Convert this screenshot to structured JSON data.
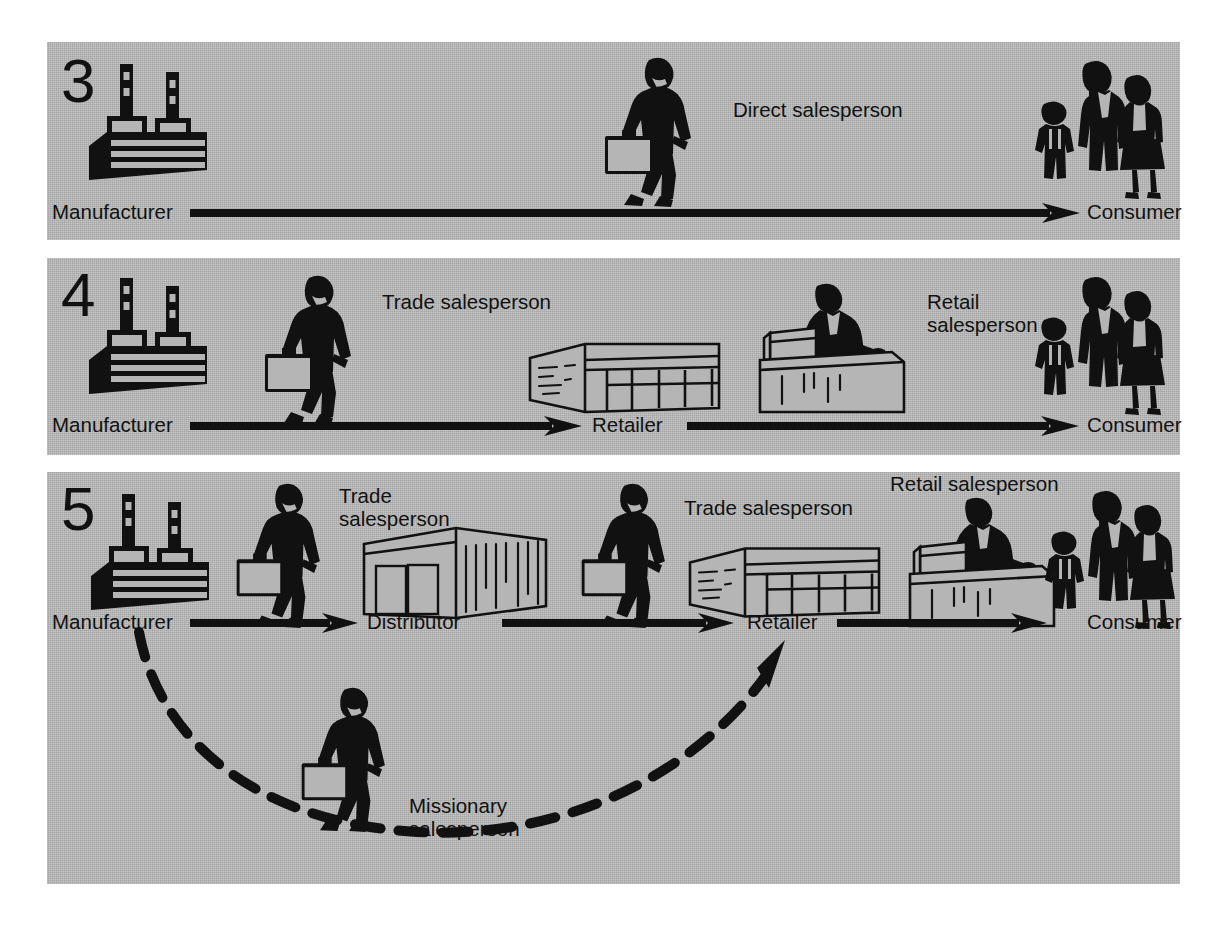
{
  "diagram": {
    "title_visible": false,
    "background_color": "#b5b5b5",
    "ink_color": "#111111",
    "panels": [
      {
        "number": "3",
        "nodes": [
          {
            "id": "manufacturer",
            "label": "Manufacturer",
            "icon": "factory-icon"
          },
          {
            "id": "consumer",
            "label": "Consumer",
            "icon": "consumer-family-icon"
          }
        ],
        "roles": [
          {
            "id": "direct-salesperson",
            "label": "Direct salesperson",
            "icon": "walking-salesperson-icon"
          }
        ],
        "arrows": [
          {
            "from": "manufacturer",
            "to": "consumer",
            "style": "solid"
          }
        ]
      },
      {
        "number": "4",
        "nodes": [
          {
            "id": "manufacturer",
            "label": "Manufacturer",
            "icon": "factory-icon"
          },
          {
            "id": "retailer",
            "label": "Retailer",
            "icon": "retail-store-icon"
          },
          {
            "id": "consumer",
            "label": "Consumer",
            "icon": "consumer-family-icon"
          }
        ],
        "roles": [
          {
            "id": "trade-salesperson",
            "label": "Trade salesperson",
            "icon": "walking-salesperson-icon"
          },
          {
            "id": "retail-salesperson",
            "label": "Retail\nsalesperson",
            "icon": "counter-salesperson-icon"
          }
        ],
        "arrows": [
          {
            "from": "manufacturer",
            "to": "retailer",
            "style": "solid"
          },
          {
            "from": "retailer",
            "to": "consumer",
            "style": "solid"
          }
        ]
      },
      {
        "number": "5",
        "nodes": [
          {
            "id": "manufacturer",
            "label": "Manufacturer",
            "icon": "factory-icon"
          },
          {
            "id": "distributor",
            "label": "Distributor",
            "icon": "warehouse-icon"
          },
          {
            "id": "retailer",
            "label": "Retailer",
            "icon": "retail-store-icon"
          },
          {
            "id": "consumer",
            "label": "Consumer",
            "icon": "consumer-family-icon"
          }
        ],
        "roles": [
          {
            "id": "trade-salesperson-1",
            "label": "Trade\nsalesperson",
            "icon": "walking-salesperson-icon"
          },
          {
            "id": "trade-salesperson-2",
            "label": "Trade salesperson",
            "icon": "walking-salesperson-icon"
          },
          {
            "id": "retail-salesperson",
            "label": "Retail salesperson",
            "icon": "counter-salesperson-icon"
          },
          {
            "id": "missionary-salesperson",
            "label": "Missionary\nsalesperson",
            "icon": "walking-salesperson-icon"
          }
        ],
        "arrows": [
          {
            "from": "manufacturer",
            "to": "distributor",
            "style": "solid"
          },
          {
            "from": "distributor",
            "to": "retailer",
            "style": "solid"
          },
          {
            "from": "retailer",
            "to": "consumer",
            "style": "solid"
          },
          {
            "from": "manufacturer",
            "to": "retailer",
            "style": "dashed-curve"
          }
        ]
      }
    ]
  }
}
